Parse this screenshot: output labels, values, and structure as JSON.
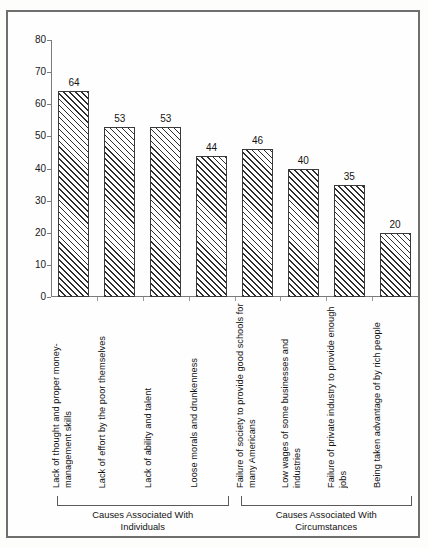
{
  "chart_data": {
    "type": "bar",
    "title": "",
    "subtitle": "",
    "xlabel": "",
    "ylabel": "",
    "ylim": [
      0,
      80
    ],
    "yticks": [
      0,
      10,
      20,
      30,
      40,
      50,
      60,
      70,
      80
    ],
    "grid": false,
    "legend": null,
    "categories": [
      "Lack of thought and proper money-management skills",
      "Lack of effort by the poor themselves",
      "Lack of ability and talent",
      "Loose morals and drunkenness",
      "Failure of society to provide good schools for many Americans",
      "Low wages of some businesses and industries",
      "Failure of private industry to provide enough jobs",
      "Being taken advantage of by rich people"
    ],
    "values": [
      64,
      53,
      53,
      44,
      46,
      40,
      35,
      20
    ],
    "value_labels": [
      "64",
      "53",
      "53",
      "44",
      "46",
      "40",
      "35",
      "20"
    ],
    "groups": [
      {
        "caption_line1": "Causes Associated With",
        "caption_line2": "Individuals",
        "start_index": 0,
        "end_index": 3
      },
      {
        "caption_line1": "Causes Associated With",
        "caption_line2": "Circumstances",
        "start_index": 4,
        "end_index": 7
      }
    ],
    "colors": {
      "bar_fill": "#ffffff",
      "bar_hatch": "#2e2e2e",
      "bar_outline": "#3a3a3a",
      "axis": "#7b7b7b",
      "text": "#121212",
      "frame": "#6f6f6f",
      "background": "#fefefe"
    }
  }
}
